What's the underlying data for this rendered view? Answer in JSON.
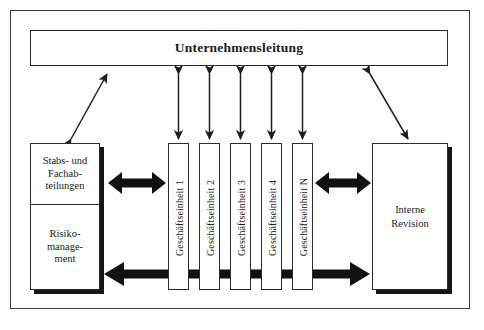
{
  "diagram": {
    "title_box": {
      "label": "Unternehmensleitung"
    },
    "left_stack": {
      "name": "stabs-und-fachabteilungen-risikomanagement",
      "cells": [
        {
          "label": "Stabs- und\nFachab-\nteilungen"
        },
        {
          "label": "Risiko-\nmanage-\nment"
        }
      ]
    },
    "business_units": [
      {
        "label": "Geschäftseinheit 1"
      },
      {
        "label": "Geschäftseinheit 2"
      },
      {
        "label": "Geschäftseinheit 3"
      },
      {
        "label": "Geschäftseinheit 4"
      },
      {
        "label": "Geschäftseinheit N"
      }
    ],
    "right_box": {
      "label": "Interne\nRevision"
    },
    "connectors": {
      "left_diagonal": "double-headed-arrow",
      "right_diagonal": "double-headed-arrow",
      "unit_verticals": "double-headed-arrow",
      "left_horizontal_thick": "thick-double-headed-arrow",
      "right_horizontal_thick": "thick-double-headed-arrow",
      "bottom_span_thick": "thick-double-headed-arrow"
    },
    "colors": {
      "line": "#2b2b2b",
      "frame": "#3b3b3b",
      "shadow": "#171717",
      "fill": "#ffffff",
      "page": "#fdfdfd"
    }
  }
}
